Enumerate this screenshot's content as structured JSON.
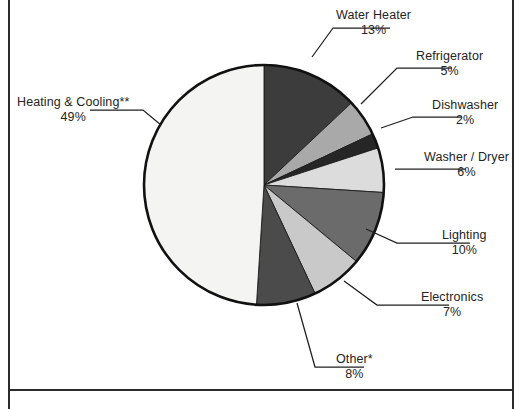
{
  "chart_data": {
    "type": "pie",
    "title": "",
    "subtitle": "",
    "xlabel": "",
    "ylabel": "",
    "legend_position": "callout-labels",
    "grid": false,
    "start_angle_deg": 0,
    "direction": "clockwise",
    "unit": "%",
    "categories": [
      "Water Heater",
      "Refrigerator",
      "Dishwasher",
      "Washer / Dryer",
      "Lighting",
      "Electronics",
      "Other*",
      "Heating & Cooling**"
    ],
    "values": [
      13,
      5,
      2,
      6,
      10,
      7,
      8,
      49
    ],
    "slices": [
      {
        "label": "Water Heater",
        "percent_text": "13%",
        "value": 13,
        "color": "#3c3c3c",
        "label_align": "align-left",
        "label_left": 336,
        "label_top": 8,
        "leader": "M 312 57 L 333 28 L 390 28"
      },
      {
        "label": "Refrigerator",
        "percent_text": "5%",
        "value": 5,
        "color": "#a9a9a9",
        "label_align": "align-left",
        "label_left": 416,
        "label_top": 49,
        "leader": "M 361 104 L 397 68 L 452 68"
      },
      {
        "label": "Dishwasher",
        "percent_text": "2%",
        "value": 2,
        "color": "#262626",
        "label_align": "align-left",
        "label_left": 432,
        "label_top": 98,
        "leader": "M 381 128 L 413 117 L 462 117"
      },
      {
        "label": "Washer / Dryer",
        "percent_text": "6%",
        "value": 6,
        "color": "#dcdcdc",
        "label_align": "align-left",
        "label_left": 424,
        "label_top": 150,
        "leader": "M 395 169 L 466 169"
      },
      {
        "label": "Lighting",
        "percent_text": "10%",
        "value": 10,
        "color": "#6b6b6b",
        "label_align": "align-left",
        "label_left": 442,
        "label_top": 228,
        "leader": "M 366 229 L 397 243 L 470 243"
      },
      {
        "label": "Electronics",
        "percent_text": "7%",
        "value": 7,
        "color": "#c9c9c9",
        "label_align": "align-left",
        "label_left": 421,
        "label_top": 290,
        "leader": "M 344 281 L 377 305 L 449 305"
      },
      {
        "label": "Other*",
        "percent_text": "8%",
        "value": 8,
        "color": "#4b4b4b",
        "label_align": "align-left",
        "label_left": 336,
        "label_top": 352,
        "leader": "M 297 303 L 315 367 L 364 367"
      },
      {
        "label": "Heating & Cooling**",
        "percent_text": "49%",
        "value": 49,
        "color": "#f4f4f2",
        "label_align": "align-right",
        "label_left": 17,
        "label_top": 95,
        "leader": "M 161 125 L 143 110 L 90 110"
      }
    ],
    "geometry": {
      "center_x": 264,
      "center_y": 185,
      "radius": 120
    }
  },
  "figure": {
    "frame_left_rule": "page-edge-rule",
    "frame_right_rule": "page-edge-rule",
    "frame_bottom_rule": "page-edge-rule"
  }
}
